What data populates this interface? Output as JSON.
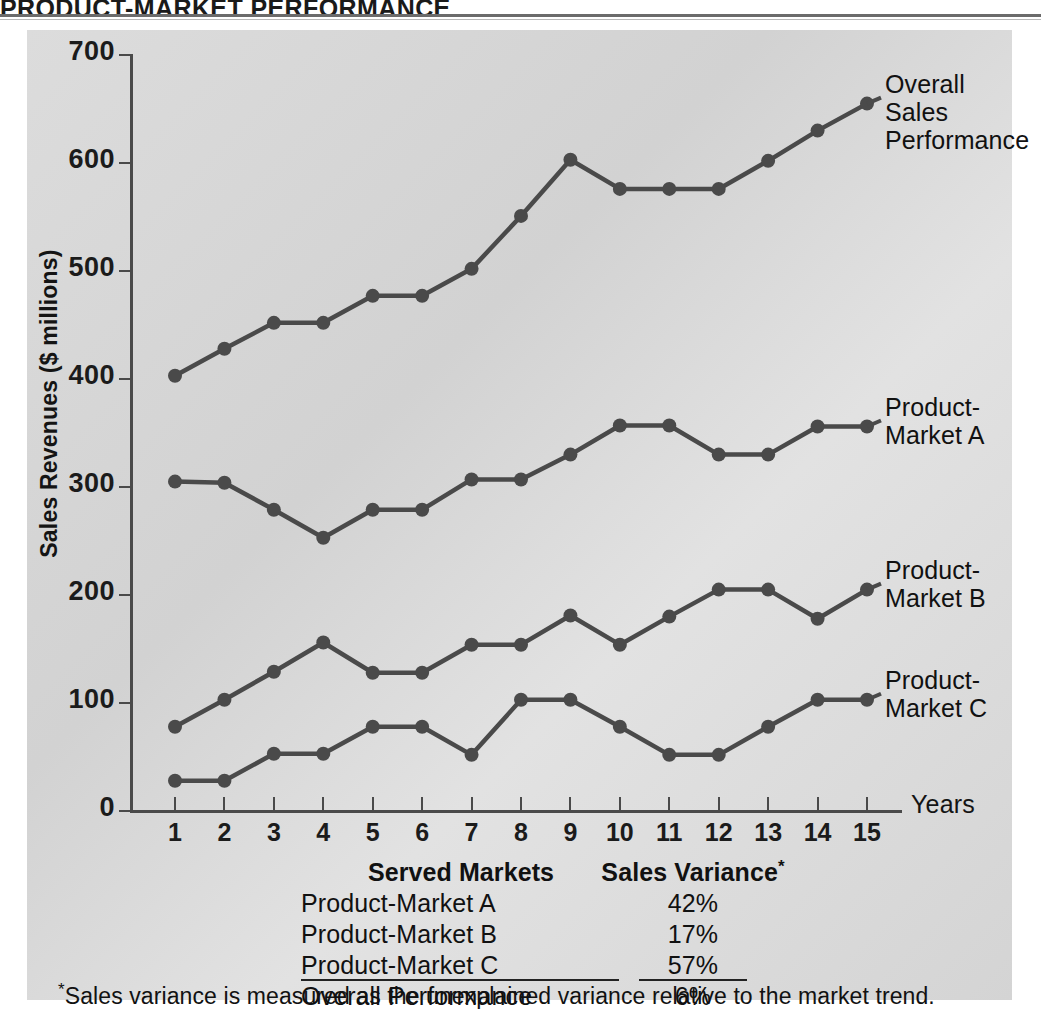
{
  "page": {
    "running_head": "PRODUCT-MARKET PERFORMANCE"
  },
  "chart_data": {
    "type": "line",
    "title": "",
    "xlabel": "Years",
    "ylabel": "Sales Revenues ($ millions)",
    "xlim": [
      1,
      15
    ],
    "ylim": [
      0,
      700
    ],
    "ytick_step": 100,
    "grid": false,
    "legend_position": "right-inline-labels",
    "categories": [
      1,
      2,
      3,
      4,
      5,
      6,
      7,
      8,
      9,
      10,
      11,
      12,
      13,
      14,
      15
    ],
    "x_tick_labels": [
      "1",
      "2",
      "3",
      "4",
      "5",
      "6",
      "7",
      "8",
      "9",
      "10",
      "11",
      "12",
      "13",
      "14",
      "15"
    ],
    "y_tick_labels": [
      "0",
      "100",
      "200",
      "300",
      "400",
      "500",
      "600",
      "700"
    ],
    "series": [
      {
        "name": "Overall Sales Performance",
        "label": "Overall Sales\nPerformance",
        "color": "#4a4a4a",
        "values": [
          403,
          428,
          452,
          452,
          477,
          477,
          502,
          551,
          603,
          576,
          576,
          576,
          602,
          630,
          655
        ]
      },
      {
        "name": "Product-Market A",
        "label": "Product-\nMarket A",
        "color": "#4a4a4a",
        "values": [
          305,
          304,
          279,
          253,
          279,
          279,
          307,
          307,
          330,
          357,
          357,
          330,
          330,
          356,
          356
        ]
      },
      {
        "name": "Product-Market B",
        "label": "Product-\nMarket B",
        "color": "#4a4a4a",
        "values": [
          78,
          103,
          129,
          156,
          128,
          128,
          154,
          154,
          181,
          154,
          180,
          205,
          205,
          178,
          205
        ]
      },
      {
        "name": "Product-Market C",
        "label": "Product-\nMarket C",
        "color": "#4a4a4a",
        "values": [
          28,
          28,
          53,
          53,
          78,
          78,
          52,
          103,
          103,
          78,
          52,
          52,
          78,
          103,
          103
        ]
      }
    ]
  },
  "table": {
    "headers": {
      "col1": "Served Markets",
      "col2": "Sales Variance",
      "col2_footnote_marker": "*"
    },
    "rows": [
      {
        "market": "Product-Market A",
        "variance": "42%"
      },
      {
        "market": "Product-Market B",
        "variance": "17%"
      },
      {
        "market": "Product-Market C",
        "variance": "57%"
      },
      {
        "market": "Overall Performance",
        "variance": "6%"
      }
    ]
  },
  "footnote": {
    "marker": "*",
    "text": "Sales variance is measured as the unexplained variance relative to the market trend."
  },
  "colors": {
    "panel_background": "#d9d9d9",
    "ink": "#4a4a4a",
    "text": "#111111",
    "page_background": "#ffffff"
  }
}
